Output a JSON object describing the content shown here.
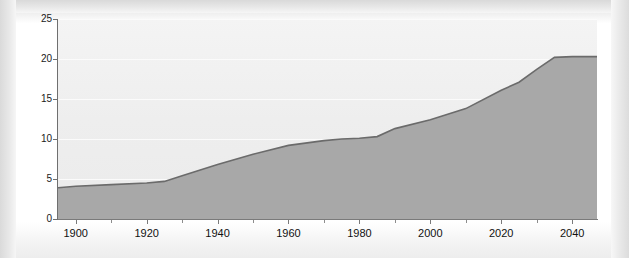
{
  "chart_data": {
    "type": "area",
    "title": "",
    "subtitle": "",
    "xlabel": "",
    "ylabel": "Age 65 and over (percentage)",
    "xlim": [
      1895,
      2047
    ],
    "ylim": [
      0,
      25
    ],
    "grid": true,
    "legend_position": "none",
    "x_ticks_major": [
      1900,
      1920,
      1940,
      1960,
      1980,
      2000,
      2020,
      2040
    ],
    "x_tick_labels": [
      "1900",
      "1920",
      "1940",
      "1960",
      "1980",
      "2000",
      "2020",
      "2040"
    ],
    "x_ticks_minor": [
      1910,
      1930,
      1950,
      1970,
      1990,
      2010,
      2030
    ],
    "y_ticks": [
      0,
      5,
      10,
      15,
      20,
      25
    ],
    "y_tick_labels": [
      "0",
      "5",
      "10",
      "15",
      "20",
      "25"
    ],
    "series": [
      {
        "name": "Age 65 and over (percentage)",
        "fill_color": "#a8a8a8",
        "line_color": "#6b6b6b",
        "x": [
          1895,
          1900,
          1910,
          1920,
          1925,
          1930,
          1940,
          1950,
          1960,
          1970,
          1975,
          1980,
          1985,
          1990,
          2000,
          2010,
          2020,
          2025,
          2030,
          2035,
          2040,
          2047
        ],
        "values": [
          3.9,
          4.1,
          4.3,
          4.5,
          4.7,
          5.4,
          6.8,
          8.1,
          9.2,
          9.8,
          10.0,
          10.1,
          10.3,
          11.3,
          12.4,
          13.8,
          16.1,
          17.1,
          18.7,
          20.2,
          20.3,
          20.3
        ]
      }
    ],
    "annotations": []
  },
  "figure": {
    "background_color": "#ffffff",
    "plot_background_color": "#f0f0f0",
    "axis_color": "#6f6f6f",
    "gridline_color": "#fbfbfb"
  }
}
